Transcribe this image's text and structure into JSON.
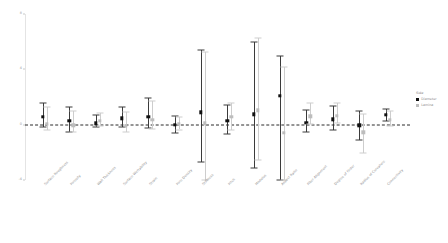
{
  "chart_data": {
    "type": "scatter",
    "title": "",
    "subtitle": "",
    "xlabel": "",
    "ylabel": "",
    "ylim": [
      -4,
      8
    ],
    "yticks": [
      8,
      4,
      0,
      -4
    ],
    "ytick_labels": [
      "8",
      "4",
      "0",
      "-4"
    ],
    "grid": false,
    "zero_reference_line": 0,
    "legend_position": "right",
    "categories": [
      "Surface Roughness",
      "Porosity",
      "Wall Thickness",
      "Surface Wettability",
      "Strain",
      "Pore Density",
      "Stiffness",
      "Pitch",
      "Modulus",
      "Aspect Ratio",
      "Fiber Alignment",
      "Degree of Order",
      "Radius of Curvature",
      "Connectivity"
    ],
    "series": [
      {
        "name": "Diameter",
        "color": "#111111",
        "values": [
          0.55,
          0.3,
          0.1,
          0.45,
          0.55,
          0.0,
          0.9,
          0.3,
          0.75,
          2.1,
          0.15,
          0.4,
          -0.05,
          0.7
        ],
        "ci_low": [
          -0.15,
          -0.55,
          -0.2,
          -0.2,
          -0.25,
          -0.6,
          -2.7,
          -0.7,
          -3.1,
          -4.55,
          -0.55,
          -0.35,
          -1.1,
          0.25
        ],
        "ci_high": [
          1.55,
          1.25,
          0.7,
          1.3,
          1.9,
          0.65,
          5.4,
          1.4,
          6.0,
          5.0,
          1.05,
          1.35,
          1.0,
          1.15
        ]
      },
      {
        "name": "Lamina",
        "color": "#bdbdbd",
        "values": [
          0.05,
          -0.05,
          0.3,
          -0.1,
          0.35,
          0.05,
          0.1,
          0.55,
          1.05,
          -0.6,
          0.6,
          0.65,
          -0.55,
          0.35
        ],
        "ci_low": [
          -0.35,
          -0.55,
          -0.1,
          -0.55,
          -0.3,
          -0.35,
          -4.05,
          -0.35,
          -2.55,
          -7.4,
          0.05,
          0.1,
          -2.05,
          -0.1
        ],
        "ci_high": [
          1.25,
          1.0,
          0.85,
          0.9,
          1.7,
          0.55,
          5.25,
          1.6,
          6.3,
          4.2,
          1.55,
          1.55,
          0.75,
          1.0
        ]
      }
    ]
  },
  "legend": {
    "title": "Side",
    "entries": [
      {
        "label": "Diameter",
        "marker": "filled-square-dark"
      },
      {
        "label": "Lamina",
        "marker": "filled-square-light"
      }
    ]
  }
}
